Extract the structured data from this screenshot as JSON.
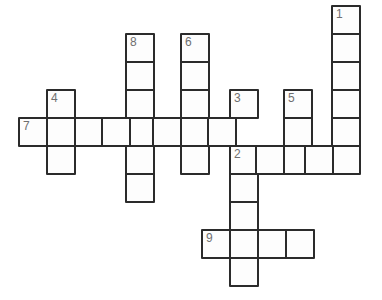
{
  "puzzle": {
    "type": "crossword-grid",
    "title": "Crossword puzzle grid",
    "cell_size": 30,
    "cell_pitch": 28,
    "origin": {
      "x": 18,
      "y": 5
    },
    "colors": {
      "cell_fill": "#fdfdfd",
      "cell_border": "#2b2b2b",
      "number_text": "#6f6f6f",
      "background": "#ffffff"
    },
    "clue_numbers": [
      "1",
      "2",
      "3",
      "4",
      "5",
      "6",
      "7",
      "8",
      "9"
    ],
    "entries": [
      {
        "number": "1",
        "direction": "down",
        "length": 6,
        "start": {
          "col": 11,
          "row": 0
        }
      },
      {
        "number": "2",
        "direction": "across",
        "length": 5,
        "start": {
          "col": 7.55,
          "row": 5
        }
      },
      {
        "number": "3",
        "direction": "down",
        "length": 7,
        "start": {
          "col": 7.55,
          "row": 3
        }
      },
      {
        "number": "4",
        "direction": "down",
        "length": 3,
        "start": {
          "col": 1,
          "row": 3
        }
      },
      {
        "number": "5",
        "direction": "down",
        "length": 3,
        "start": {
          "col": 9.45,
          "row": 3
        }
      },
      {
        "number": "6",
        "direction": "down",
        "length": 5,
        "start": {
          "col": 5.8,
          "row": 1
        }
      },
      {
        "number": "7",
        "direction": "across",
        "length": 9,
        "start": {
          "col": 0,
          "row": 4
        }
      },
      {
        "number": "8",
        "direction": "down",
        "length": 6,
        "start": {
          "col": 3.8,
          "row": 1
        }
      },
      {
        "number": "9",
        "direction": "across",
        "length": 4,
        "start": {
          "col": 6.55,
          "row": 8
        }
      }
    ],
    "cells": [
      {
        "name": "cell-1-start",
        "x": 331,
        "y": 5,
        "number": "1"
      },
      {
        "name": "cell-col1-r1",
        "x": 331,
        "y": 33,
        "number": ""
      },
      {
        "name": "cell-col1-r2",
        "x": 331,
        "y": 61,
        "number": ""
      },
      {
        "name": "cell-col1-r3",
        "x": 331,
        "y": 89,
        "number": ""
      },
      {
        "name": "cell-col1-r4",
        "x": 331,
        "y": 117,
        "number": ""
      },
      {
        "name": "cell-col1-r5",
        "x": 331,
        "y": 145,
        "number": ""
      },
      {
        "name": "cell-8-start",
        "x": 125,
        "y": 33,
        "number": "8"
      },
      {
        "name": "cell-col8-r2",
        "x": 125,
        "y": 61,
        "number": ""
      },
      {
        "name": "cell-col8-r3",
        "x": 125,
        "y": 89,
        "number": ""
      },
      {
        "name": "cell-col8-r4",
        "x": 125,
        "y": 117,
        "number": ""
      },
      {
        "name": "cell-col8-r5",
        "x": 125,
        "y": 145,
        "number": ""
      },
      {
        "name": "cell-col8-r6",
        "x": 125,
        "y": 173,
        "number": ""
      },
      {
        "name": "cell-6-start",
        "x": 180,
        "y": 33,
        "number": "6"
      },
      {
        "name": "cell-col6-r2",
        "x": 180,
        "y": 61,
        "number": ""
      },
      {
        "name": "cell-col6-r3",
        "x": 180,
        "y": 89,
        "number": ""
      },
      {
        "name": "cell-col6-r4",
        "x": 180,
        "y": 117,
        "number": ""
      },
      {
        "name": "cell-col6-r5",
        "x": 180,
        "y": 145,
        "number": ""
      },
      {
        "name": "cell-4-start",
        "x": 46,
        "y": 89,
        "number": "4"
      },
      {
        "name": "cell-col4-r4",
        "x": 46,
        "y": 117,
        "number": ""
      },
      {
        "name": "cell-col4-r5",
        "x": 46,
        "y": 145,
        "number": ""
      },
      {
        "name": "cell-3-start",
        "x": 229,
        "y": 89,
        "number": "3"
      },
      {
        "name": "cell-2-start",
        "x": 229,
        "y": 145,
        "number": "2"
      },
      {
        "name": "cell-col3-r6",
        "x": 229,
        "y": 173,
        "number": ""
      },
      {
        "name": "cell-col3-r7",
        "x": 229,
        "y": 201,
        "number": ""
      },
      {
        "name": "cell-col3-r8",
        "x": 229,
        "y": 229,
        "number": ""
      },
      {
        "name": "cell-col3-r9",
        "x": 229,
        "y": 257,
        "number": ""
      },
      {
        "name": "cell-5-start",
        "x": 283,
        "y": 89,
        "number": "5"
      },
      {
        "name": "cell-col5-r4",
        "x": 283,
        "y": 117,
        "number": ""
      },
      {
        "name": "cell-col5-r5",
        "x": 283,
        "y": 145,
        "number": ""
      },
      {
        "name": "cell-7-start",
        "x": 18,
        "y": 117,
        "number": "7"
      },
      {
        "name": "cell-row7-c2",
        "x": 74,
        "y": 117,
        "number": ""
      },
      {
        "name": "cell-row7-c3",
        "x": 101,
        "y": 117,
        "number": ""
      },
      {
        "name": "cell-row7-c5",
        "x": 152,
        "y": 117,
        "number": ""
      },
      {
        "name": "cell-row7-c7",
        "x": 207,
        "y": 117,
        "number": ""
      },
      {
        "name": "cell-row2-c8",
        "x": 255,
        "y": 145,
        "number": ""
      },
      {
        "name": "cell-row2-c9",
        "x": 283,
        "y": 145,
        "number": ""
      },
      {
        "name": "cell-row2-c10",
        "x": 304,
        "y": 145,
        "number": ""
      },
      {
        "name": "cell-9-start",
        "x": 201,
        "y": 229,
        "number": "9"
      },
      {
        "name": "cell-row9-c8",
        "x": 257,
        "y": 229,
        "number": ""
      },
      {
        "name": "cell-row9-c9",
        "x": 285,
        "y": 229,
        "number": ""
      }
    ]
  }
}
